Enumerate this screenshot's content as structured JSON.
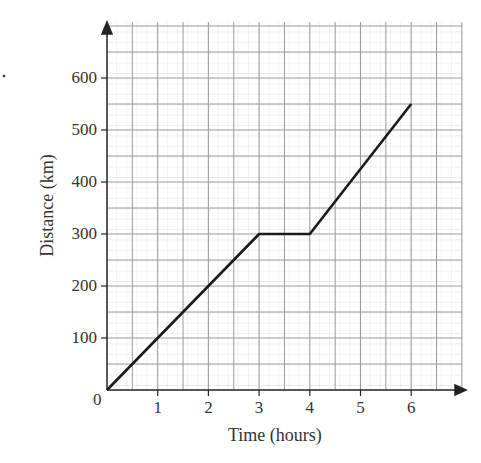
{
  "chart_data": {
    "type": "line",
    "title": "",
    "xlabel": "Time (hours)",
    "ylabel": "Distance (km)",
    "x": [
      0,
      3,
      4,
      6
    ],
    "series": [
      {
        "name": "Distance",
        "values": [
          0,
          300,
          300,
          550
        ]
      }
    ],
    "xticks": [
      "1",
      "2",
      "3",
      "4",
      "5",
      "6"
    ],
    "yticks": [
      "100",
      "200",
      "300",
      "400",
      "500",
      "600"
    ],
    "origin_label": "0",
    "xlim": [
      0,
      7
    ],
    "ylim": [
      0,
      700
    ],
    "grid": true,
    "legend": null
  },
  "axis": {
    "xlabel": "Time (hours)",
    "ylabel": "Distance (km)",
    "origin": "0",
    "xticks": [
      "1",
      "2",
      "3",
      "4",
      "5",
      "6"
    ],
    "yticks": [
      "100",
      "200",
      "300",
      "400",
      "500",
      "600"
    ]
  },
  "stray_mark": "."
}
